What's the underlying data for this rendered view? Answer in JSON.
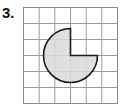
{
  "problem": {
    "number_label": "3."
  },
  "figure": {
    "grid": {
      "columns": 6,
      "rows": 6,
      "line_color": "#9a9a9a",
      "border_color": "#8a8a8a"
    },
    "shape": {
      "type": "circle-with-missing-quarter",
      "missing_quadrant": "top-right",
      "center_grid_point": [
        3,
        3
      ],
      "radius_cells": 1.75,
      "fill_color": "#d9d9d9",
      "stroke_color": "#1a1a1a"
    }
  }
}
